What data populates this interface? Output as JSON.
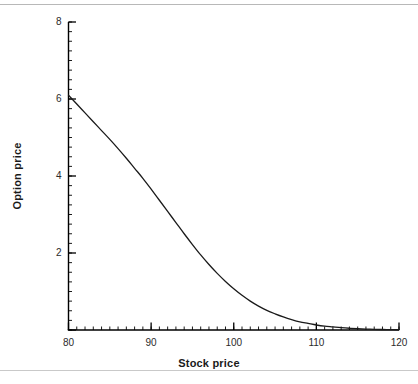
{
  "figure": {
    "width": 418,
    "height": 384,
    "background": "#ffffff",
    "rule_color": "#b8b8b8",
    "axis_color": "#000000",
    "curve_color": "#1a1a1a"
  },
  "labels": {
    "x_axis_title": "Stock price",
    "y_axis_title": "Option price"
  },
  "chart_data": {
    "type": "line",
    "title": "",
    "subtitle": "",
    "xlabel": "Stock price",
    "ylabel": "Option price",
    "xlim": [
      80,
      120
    ],
    "ylim": [
      0,
      8
    ],
    "xticks": [
      80,
      90,
      100,
      110,
      120
    ],
    "xtick_labels": [
      "80",
      "90",
      "100",
      "110",
      "120"
    ],
    "yticks": [
      0,
      2,
      4,
      6,
      8
    ],
    "ytick_labels": [
      "",
      "2",
      "4",
      "6",
      "8"
    ],
    "x_minor_tick_step": 1,
    "y_minor_tick_step": 0.25,
    "grid": false,
    "legend": null,
    "annotations": [],
    "series": [
      {
        "name": "Option price",
        "x": [
          80,
          81,
          82,
          83,
          84,
          85,
          86,
          87,
          88,
          89,
          90,
          91,
          92,
          93,
          94,
          95,
          96,
          97,
          98,
          99,
          100,
          101,
          102,
          103,
          104,
          105,
          106,
          107,
          108,
          109,
          110,
          111,
          112,
          113,
          114,
          115,
          116,
          117,
          118,
          119,
          120
        ],
        "values": [
          6.1,
          5.87,
          5.64,
          5.41,
          5.18,
          4.95,
          4.71,
          4.46,
          4.2,
          3.94,
          3.66,
          3.37,
          3.08,
          2.79,
          2.5,
          2.22,
          1.95,
          1.7,
          1.47,
          1.26,
          1.07,
          0.9,
          0.75,
          0.62,
          0.51,
          0.42,
          0.34,
          0.27,
          0.21,
          0.17,
          0.13,
          0.1,
          0.08,
          0.06,
          0.045,
          0.034,
          0.025,
          0.018,
          0.013,
          0.009,
          0.006
        ]
      }
    ]
  }
}
